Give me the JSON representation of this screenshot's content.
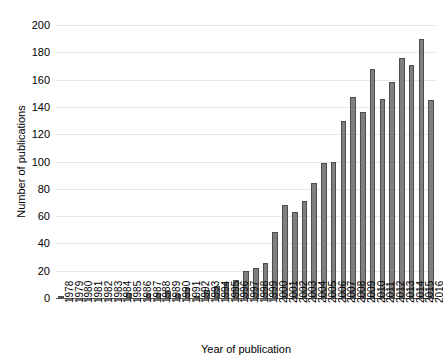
{
  "chart_data": {
    "type": "bar",
    "title": "",
    "xlabel": "Year of publication",
    "ylabel": "Number of publications",
    "ylim": [
      0,
      200
    ],
    "yticks": [
      0,
      20,
      40,
      60,
      80,
      100,
      120,
      140,
      160,
      180,
      200
    ],
    "grid": true,
    "legend": null,
    "bar_color": "#7f7f7f",
    "bar_edge_color": "#4d4d4d",
    "categories": [
      "1978",
      "1979",
      "1980",
      "1981",
      "1982",
      "1983",
      "1984",
      "1985",
      "1986",
      "1987",
      "1988",
      "1989",
      "1990",
      "1991",
      "1992",
      "1993",
      "1994",
      "1995",
      "1996",
      "1997",
      "1998",
      "1999",
      "2000",
      "2001",
      "2002",
      "2003",
      "2004",
      "2005",
      "2006",
      "2007",
      "2008",
      "2009",
      "2010",
      "2011",
      "2012",
      "2013",
      "2014",
      "2015",
      "2016"
    ],
    "values": [
      1,
      0,
      0,
      0,
      0,
      0,
      0,
      4,
      0,
      3,
      4,
      5,
      3,
      7,
      1,
      6,
      9,
      12,
      13,
      20,
      22,
      26,
      48,
      68,
      63,
      71,
      84,
      99,
      100,
      130,
      147,
      136,
      168,
      146,
      158,
      176,
      171,
      190,
      145
    ]
  }
}
